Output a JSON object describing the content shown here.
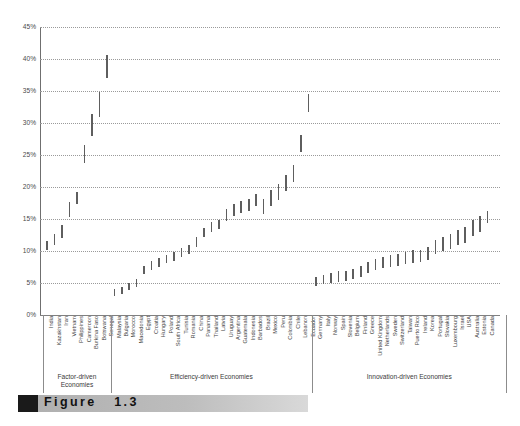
{
  "figure": {
    "caption_label": "Figure",
    "caption_number": "1.3",
    "marker_icon": "black-square-icon"
  },
  "chart_data": {
    "type": "bar",
    "title": "",
    "subtitle": "",
    "xlabel": "",
    "ylabel": "",
    "ylim": [
      0,
      45
    ],
    "grid": true,
    "legend": null,
    "value_unit": "%",
    "note": "Each vertical bar spans a low-to-high range (interval estimate) per economy.",
    "y_ticks": [
      "0%",
      "5%",
      "10%",
      "15%",
      "20%",
      "25%",
      "30%",
      "35%",
      "40%",
      "45%"
    ],
    "y_tick_values": [
      0,
      5,
      10,
      15,
      20,
      25,
      30,
      35,
      40,
      45
    ],
    "groups": [
      {
        "label": "Factor-driven\nEconomies",
        "label_line1": "Factor-driven",
        "label_line2": "Economies",
        "start": 0,
        "end": 9
      },
      {
        "label": "Efficiency-driven Economies",
        "label_line1": "Efficiency-driven Economies",
        "label_line2": "",
        "start": 9,
        "end": 36
      },
      {
        "label": "Innovation-driven Economies",
        "label_line1": "Innovation-driven Economies",
        "label_line2": "",
        "start": 36,
        "end": 62
      }
    ],
    "categories": [
      "India",
      "Kazakhstan",
      "Iran",
      "Vietnam",
      "Philippines",
      "Cameroon",
      "Burkina Faso",
      "Botswana",
      "Senegal",
      "Malaysia",
      "Bulgaria",
      "Morocco",
      "Macedonia",
      "Egypt",
      "Croatia",
      "Hungary",
      "Poland",
      "South Africa",
      "Tunisia",
      "Romania",
      "China",
      "Panama",
      "Thailand",
      "Latvia",
      "Uruguay",
      "Argentina",
      "Guatemala",
      "Indonesia",
      "Barbados",
      "Brazil",
      "Mexico",
      "Peru",
      "Colombia",
      "Chile",
      "Lebanon",
      "Ecuador",
      "Germany",
      "Italy",
      "Norway",
      "Spain",
      "Slovenia",
      "Belgium",
      "Finland",
      "Greece",
      "United Kingdom",
      "Netherlands",
      "Sweden",
      "Switzerland",
      "Taiwan",
      "Puerto Rico",
      "Ireland",
      "Korea",
      "Portugal",
      "Slovakia",
      "Luxembourg",
      "Israel",
      "USA",
      "Australia",
      "Estonia",
      "Canada"
    ],
    "ranges_low": [
      10.2,
      10.9,
      12.0,
      15.3,
      17.3,
      23.8,
      28.0,
      31.0,
      37.0,
      2.9,
      3.3,
      3.9,
      4.4,
      6.4,
      7.1,
      7.5,
      8.1,
      8.4,
      9.1,
      9.5,
      10.7,
      12.2,
      13.0,
      13.4,
      14.7,
      15.5,
      16.0,
      16.3,
      17.0,
      15.8,
      17.1,
      18.0,
      19.3,
      20.8,
      25.4,
      31.7,
      4.6,
      4.8,
      5.0,
      5.2,
      5.3,
      5.6,
      5.9,
      6.6,
      7.0,
      7.3,
      7.5,
      7.7,
      7.9,
      8.2,
      8.3,
      8.6,
      9.6,
      10.0,
      10.3,
      11.0,
      11.3,
      12.3,
      13.0,
      14.4
    ],
    "ranges_high": [
      11.6,
      12.6,
      14.1,
      17.7,
      19.2,
      26.6,
      31.4,
      34.9,
      40.6,
      4.0,
      4.4,
      5.0,
      5.6,
      7.7,
      8.4,
      8.9,
      9.4,
      9.8,
      10.4,
      10.9,
      12.2,
      13.6,
      14.5,
      14.8,
      16.5,
      17.3,
      17.8,
      18.1,
      18.9,
      18.1,
      19.5,
      20.5,
      21.9,
      23.4,
      28.1,
      34.6,
      6.0,
      6.2,
      6.5,
      6.8,
      6.9,
      7.2,
      7.6,
      8.3,
      8.7,
      9.0,
      9.3,
      9.5,
      9.8,
      10.1,
      10.2,
      10.6,
      11.7,
      12.2,
      12.6,
      13.3,
      13.7,
      14.8,
      15.5,
      16.2
    ]
  }
}
